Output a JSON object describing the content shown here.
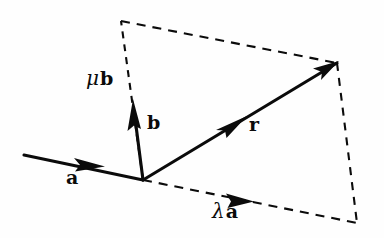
{
  "figure": {
    "background_color": "#fefefe",
    "ink_color": "#0b0b0b",
    "width": 384,
    "height": 238
  },
  "labels": {
    "vector_a": "a",
    "vector_b": "b",
    "vector_r": "r",
    "mu_symbol": "μ",
    "mu_b_vector": "b",
    "lambda_symbol": "λ",
    "lambda_a_vector": "a"
  },
  "geometry": {
    "origin": {
      "x": 143,
      "y": 180
    },
    "vectors": [
      {
        "name": "a",
        "style": "solid",
        "from": {
          "x": 24,
          "y": 155
        },
        "to": {
          "x": 143,
          "y": 180
        },
        "arrow_at": {
          "x": 98,
          "y": 164
        },
        "arrow_direction": "mid-forward"
      },
      {
        "name": "b",
        "style": "solid",
        "from": {
          "x": 143,
          "y": 180
        },
        "to": {
          "x": 133,
          "y": 100
        },
        "arrow_at": {
          "x": 133,
          "y": 100
        },
        "arrow_direction": "tip"
      },
      {
        "name": "r",
        "style": "solid",
        "from": {
          "x": 143,
          "y": 180
        },
        "to": {
          "x": 337,
          "y": 63
        },
        "arrow_at": {
          "x": 240,
          "y": 121
        },
        "arrow_direction": "mid-forward"
      },
      {
        "name": "lambda-a",
        "style": "dashed",
        "from": {
          "x": 143,
          "y": 180
        },
        "to": {
          "x": 357,
          "y": 223
        },
        "arrow_at": {
          "x": 248,
          "y": 201
        },
        "arrow_direction": "mid-forward"
      },
      {
        "name": "mu-b",
        "style": "dashed",
        "from": {
          "x": 143,
          "y": 180
        },
        "to": {
          "x": 121,
          "y": 21
        },
        "arrow_direction": "none"
      }
    ],
    "dashed_edges": [
      {
        "name": "top-edge",
        "from": {
          "x": 121,
          "y": 21
        },
        "to": {
          "x": 337,
          "y": 63
        }
      },
      {
        "name": "right-edge",
        "from": {
          "x": 337,
          "y": 63
        },
        "to": {
          "x": 357,
          "y": 223
        }
      }
    ]
  }
}
